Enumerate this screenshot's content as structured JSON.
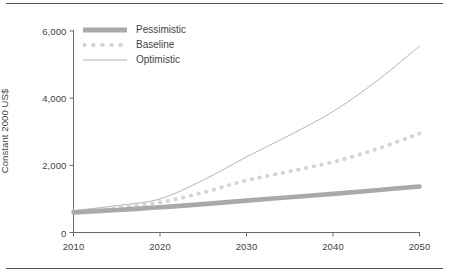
{
  "chart_data": {
    "type": "line",
    "title": "",
    "subtitle": "",
    "xlabel": "",
    "ylabel": "Constant 2000 US$",
    "x": [
      2010,
      2015,
      2020,
      2025,
      2030,
      2035,
      2040,
      2045,
      2050
    ],
    "xlim": [
      2010,
      2050
    ],
    "ylim": [
      0,
      6000
    ],
    "xticks": [
      "2010",
      "2020",
      "2030",
      "2040",
      "2050"
    ],
    "xtick_values": [
      2010,
      2020,
      2030,
      2040,
      2050
    ],
    "yticks": [
      "0",
      "2,000",
      "4,000",
      "6,000"
    ],
    "ytick_values": [
      0,
      2000,
      4000,
      6000
    ],
    "grid": false,
    "legend_position": "top-left",
    "series": [
      {
        "name": "Pessimistic",
        "style": "thick-solid",
        "color": "#a9a9a9",
        "values": [
          600,
          670,
          750,
          845,
          950,
          1050,
          1150,
          1260,
          1370
        ]
      },
      {
        "name": "Baseline",
        "style": "dotted",
        "color": "#d4d4d4",
        "values": [
          630,
          745,
          900,
          1190,
          1550,
          1820,
          2100,
          2480,
          2950
        ]
      },
      {
        "name": "Optimistic",
        "style": "thin-solid",
        "color": "#b4b4b4",
        "values": [
          650,
          800,
          1000,
          1560,
          2250,
          2900,
          3600,
          4500,
          5550
        ]
      }
    ]
  },
  "legend": {
    "items": [
      {
        "label": "Pessimistic",
        "icon": "thick-line-swatch-icon"
      },
      {
        "label": "Baseline",
        "icon": "dotted-line-swatch-icon"
      },
      {
        "label": "Optimistic",
        "icon": "thin-line-swatch-icon"
      }
    ]
  },
  "axes": {
    "y_title": "Constant 2000 US$",
    "y_labels": [
      "6,000",
      "4,000",
      "2,000",
      "0"
    ],
    "x_labels": [
      "2010",
      "2020",
      "2030",
      "2040",
      "2050"
    ]
  },
  "colors": {
    "pessimistic": "#a9a9a9",
    "baseline": "#d4d4d4",
    "optimistic": "#b4b4b4",
    "axis": "#6b6b6b",
    "text": "#3f3f3f",
    "rule": "#555555"
  }
}
